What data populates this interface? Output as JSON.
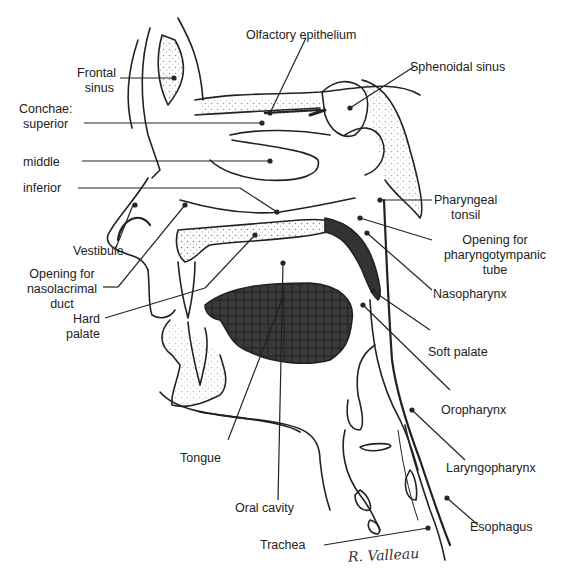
{
  "figure": {
    "signature": "R. Valleau",
    "labels": {
      "olfactory_epithelium": "Olfactory epithelium",
      "frontal_sinus_1": "Frontal",
      "frontal_sinus_2": "sinus",
      "sphenoidal_sinus": "Sphenoidal sinus",
      "conchae_1": "Conchae:",
      "conchae_superior": "superior",
      "conchae_middle": "middle",
      "conchae_inferior": "inferior",
      "pharyngeal_tonsil_1": "Pharyngeal",
      "pharyngeal_tonsil_2": "tonsil",
      "vestibule": "Vestibule",
      "pharyngotympanic_1": "Opening for",
      "pharyngotympanic_2": "pharyngotympanic",
      "pharyngotympanic_3": "tube",
      "nasolacrimal_1": "Opening for",
      "nasolacrimal_2": "nasolacrimal",
      "nasolacrimal_3": "duct",
      "nasopharynx": "Nasopharynx",
      "hard_palate_1": "Hard",
      "hard_palate_2": "palate",
      "soft_palate": "Soft palate",
      "oropharynx": "Oropharynx",
      "tongue": "Tongue",
      "laryngopharynx": "Laryngopharynx",
      "oral_cavity": "Oral cavity",
      "esophagus": "Esophagus",
      "trachea": "Trachea"
    }
  }
}
